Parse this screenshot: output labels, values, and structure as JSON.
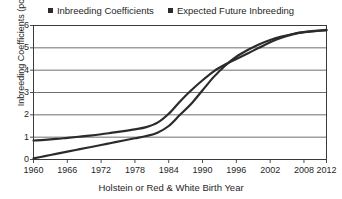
{
  "chart_data": {
    "type": "line",
    "title": "",
    "xlabel": "Holstein or Red & White Birth Year",
    "ylabel": "Inbreeding Coefficients (pct)",
    "xlim": [
      1960,
      2012
    ],
    "ylim": [
      0,
      6
    ],
    "grid": true,
    "legend_position": "top-center",
    "xticks": [
      "1960",
      "1966",
      "1972",
      "1978",
      "1984",
      "1990",
      "1996",
      "2002",
      "2008",
      "2012"
    ],
    "xtick_values": [
      1960,
      1966,
      1972,
      1978,
      1984,
      1990,
      1996,
      2002,
      2008,
      2012
    ],
    "yticks": [
      "0",
      "1",
      "2",
      "3",
      "4",
      "5",
      "6"
    ],
    "ytick_values": [
      0,
      1,
      2,
      3,
      4,
      5,
      6
    ],
    "x": [
      1960,
      1962,
      1964,
      1966,
      1968,
      1970,
      1972,
      1974,
      1976,
      1978,
      1980,
      1982,
      1984,
      1986,
      1988,
      1990,
      1992,
      1994,
      1996,
      1998,
      2000,
      2002,
      2004,
      2006,
      2008,
      2010,
      2012
    ],
    "series": [
      {
        "name": "Inbreeding Coefficients",
        "color": "#2b2b2b",
        "values": [
          0.05,
          0.15,
          0.25,
          0.35,
          0.45,
          0.55,
          0.65,
          0.75,
          0.85,
          0.95,
          1.05,
          1.2,
          1.5,
          2.0,
          2.5,
          3.1,
          3.7,
          4.2,
          4.6,
          4.9,
          5.15,
          5.35,
          5.5,
          5.62,
          5.7,
          5.75,
          5.78
        ]
      },
      {
        "name": "Expected Future Inbreeding",
        "color": "#2b2b2b",
        "values": [
          0.85,
          0.88,
          0.92,
          0.97,
          1.02,
          1.07,
          1.13,
          1.2,
          1.27,
          1.35,
          1.45,
          1.65,
          2.05,
          2.6,
          3.1,
          3.55,
          3.95,
          4.25,
          4.5,
          4.75,
          5.0,
          5.25,
          5.45,
          5.6,
          5.7,
          5.76,
          5.8
        ]
      }
    ]
  },
  "legend": {
    "items": [
      {
        "label": "Inbreeding Coefficients",
        "color": "#2b2b2b"
      },
      {
        "label": "Expected Future Inbreeding",
        "color": "#2b2b2b"
      }
    ]
  }
}
